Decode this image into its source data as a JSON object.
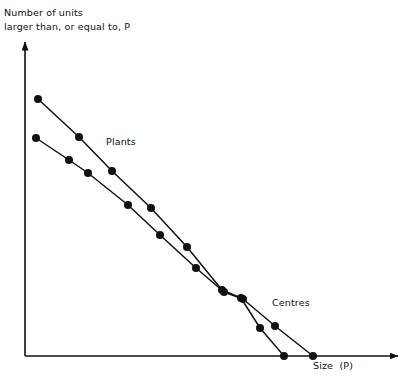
{
  "chart_data": {
    "type": "line",
    "title": "",
    "subtitle": "",
    "ylabel": "Number of units\nlarger than, or equal to, P",
    "xlabel": "Size  (P)",
    "grid": false,
    "legend_position": "inline-annotations",
    "axis_style": "arrow-ended open axes, no tick marks, no tick labels",
    "axis_ranges": {
      "x": [
        0,
        1
      ],
      "y": [
        0,
        1
      ],
      "note": "Axes are unlabelled/unscaled (rank-size log-log style plot)"
    },
    "annotations": [
      {
        "text": "Plants",
        "x": 106,
        "y": 135
      },
      {
        "text": "Centres",
        "x": 272,
        "y": 296
      }
    ],
    "series": [
      {
        "name": "Plants",
        "marker": "filled-circle",
        "points_px": [
          [
            38,
            99
          ],
          [
            79,
            137
          ],
          [
            112,
            171
          ],
          [
            151,
            208
          ],
          [
            187,
            247
          ],
          [
            222,
            290
          ],
          [
            241,
            298
          ],
          [
            260,
            328
          ],
          [
            284,
            356
          ]
        ]
      },
      {
        "name": "Centres",
        "marker": "filled-circle",
        "points_px": [
          [
            36,
            138
          ],
          [
            69,
            160
          ],
          [
            88,
            173
          ],
          [
            128,
            205
          ],
          [
            160,
            235
          ],
          [
            196,
            268
          ],
          [
            224,
            292
          ],
          [
            243,
            299
          ],
          [
            275,
            326
          ],
          [
            313,
            356
          ]
        ]
      }
    ],
    "colors": {
      "line": "#111111",
      "marker": "#111111",
      "axis": "#111111",
      "background": "#ffffff"
    }
  },
  "axes": {
    "y_axis": {
      "x": 25,
      "y_top": 42,
      "y_bottom": 356
    },
    "x_axis": {
      "y": 356,
      "x_left": 25,
      "x_right": 398
    }
  }
}
